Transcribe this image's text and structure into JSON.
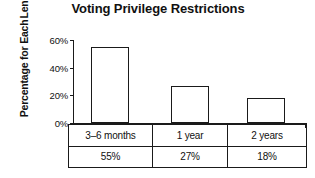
{
  "chart_data": {
    "type": "bar",
    "title": "Voting Privilege Restrictions",
    "xlabel": "",
    "ylabel": "Percentage for Each Length",
    "ylabel_lines": [
      "Percentage for Each",
      "Length"
    ],
    "categories": [
      "3–6 months",
      "1 year",
      "2 years"
    ],
    "values": [
      55,
      27,
      18
    ],
    "value_labels": [
      "55%",
      "27%",
      "18%"
    ],
    "ylim": [
      0,
      60
    ],
    "yticks": [
      0,
      20,
      40,
      60
    ],
    "ytick_labels": [
      "0%",
      "20%",
      "40%",
      "60%"
    ],
    "grid": false,
    "legend": "none",
    "bar_fill": "#ffffff",
    "bar_stroke": "#1a1a1a",
    "axis_color": "#1a1a1a",
    "text_color": "#111111",
    "table": {
      "rows": [
        [
          "3–6 months",
          "1 year",
          "2 years"
        ],
        [
          "55%",
          "27%",
          "18%"
        ]
      ]
    }
  }
}
